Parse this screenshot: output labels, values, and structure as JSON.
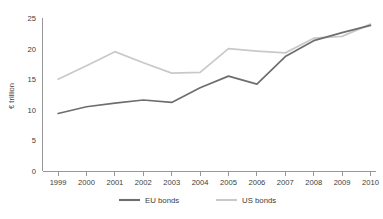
{
  "chart_data": {
    "type": "line",
    "title": "",
    "subtitle": "",
    "xlabel": "",
    "ylabel": "€ trillion",
    "x": [
      "1999",
      "2000",
      "2001",
      "2002",
      "2003",
      "2004",
      "2005",
      "2006",
      "2007",
      "2008",
      "2009",
      "2010"
    ],
    "categories": [
      "1999",
      "2000",
      "2001",
      "2002",
      "2003",
      "2004",
      "2005",
      "2006",
      "2007",
      "2008",
      "2009",
      "2010"
    ],
    "series": [
      {
        "name": "EU bonds",
        "color": "#6e6e6e",
        "values": [
          9.4,
          10.5,
          11.1,
          11.6,
          11.2,
          13.6,
          15.5,
          14.2,
          18.7,
          21.3,
          22.6,
          23.8
        ]
      },
      {
        "name": "US bonds",
        "color": "#c9c9c9",
        "values": [
          15.0,
          17.2,
          19.5,
          17.7,
          16.0,
          16.1,
          20.0,
          19.6,
          19.3,
          21.7,
          22.0,
          24.0
        ]
      }
    ],
    "ylim": [
      0,
      25
    ],
    "yticks": [
      0,
      5,
      10,
      15,
      20,
      25
    ],
    "ytick_labels": [
      "0",
      "5",
      "10",
      "15",
      "20",
      "25"
    ],
    "xtick_labels": [
      "1999",
      "2000",
      "2001",
      "2002",
      "2003",
      "2004",
      "2005",
      "2006",
      "2007",
      "2008",
      "2009",
      "2010"
    ],
    "grid": false,
    "legend_position": "bottom",
    "legend": [
      "EU bonds",
      "US bonds"
    ]
  },
  "axes": {
    "y_axis_title": "€ trillion"
  },
  "legend": {
    "items": [
      {
        "label": "EU bonds"
      },
      {
        "label": "US bonds"
      }
    ]
  },
  "colors": {
    "eu_bonds": "#6e6e6e",
    "us_bonds": "#c9c9c9",
    "axis": "#8c8c8c",
    "text": "#3c3c3c",
    "background": "#ffffff"
  },
  "footer": {
    "caption": ""
  }
}
